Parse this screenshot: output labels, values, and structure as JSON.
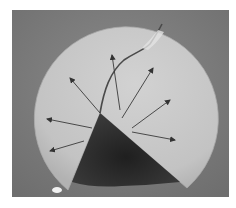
{
  "image": {
    "description": "Grayscale photograph of a fractured circular disc specimen with a missing wedge sector; arrows radiate from the wedge tip indicating crack/stress directions",
    "colors": {
      "background": "#7c7c7c",
      "disc": "#c9c9c9",
      "disc_shadow": "#b4b4b4",
      "wedge": "#2b2b2b",
      "arrow": "#3a3a3a",
      "crack": "#4a4a4a"
    },
    "arrows": [
      {
        "name": "arrow-upper-left",
        "from": [
          88,
          103
        ],
        "to": [
          58,
          68
        ]
      },
      {
        "name": "arrow-up",
        "from": [
          108,
          100
        ],
        "to": [
          100,
          45
        ]
      },
      {
        "name": "arrow-up-right",
        "from": [
          110,
          108
        ],
        "to": [
          141,
          58
        ]
      },
      {
        "name": "arrow-right-up",
        "from": [
          120,
          118
        ],
        "to": [
          158,
          90
        ]
      },
      {
        "name": "arrow-right",
        "from": [
          120,
          122
        ],
        "to": [
          163,
          130
        ]
      },
      {
        "name": "arrow-left",
        "from": [
          80,
          118
        ],
        "to": [
          35,
          109
        ]
      },
      {
        "name": "arrow-lower-left",
        "from": [
          72,
          131
        ],
        "to": [
          38,
          141
        ]
      }
    ]
  }
}
